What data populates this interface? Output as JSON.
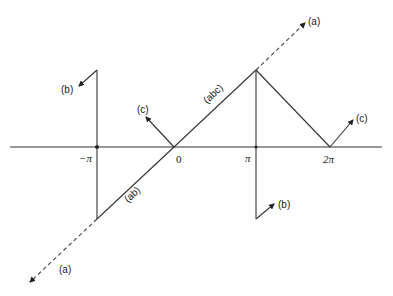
{
  "diagram": {
    "axis_ticks": [
      {
        "id": "neg-pi",
        "label": "−π"
      },
      {
        "id": "zero",
        "label": "0"
      },
      {
        "id": "pi",
        "label": "π"
      },
      {
        "id": "two-pi",
        "label": "2π"
      }
    ],
    "labels": {
      "a_top": "(a)",
      "a_bottom": "(a)",
      "b_top": "(b)",
      "b_bottom": "(b)",
      "c_left": "(c)",
      "c_right": "(c)",
      "ab": "(ab)",
      "abc": "(abc)"
    },
    "colors": {
      "line": "#333333",
      "text": "#222222"
    }
  }
}
